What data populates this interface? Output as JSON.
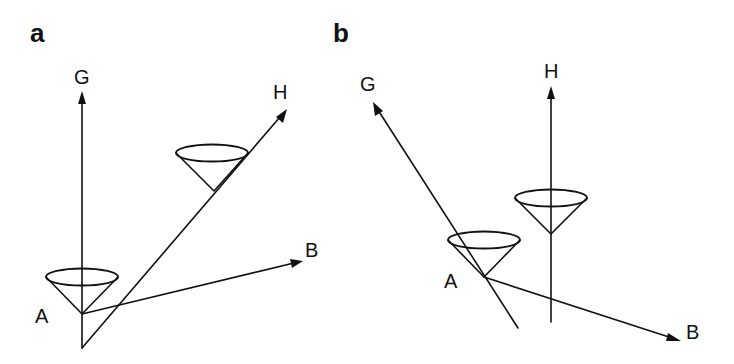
{
  "figure": {
    "panels": [
      {
        "id": "a",
        "label": "a",
        "vectors": {
          "G": {
            "label": "G",
            "direction": "vertical up"
          },
          "H": {
            "label": "H",
            "direction": "diagonal up-right"
          },
          "B": {
            "label": "B",
            "direction": "right, slightly up"
          }
        },
        "point_label": "A",
        "cones": [
          {
            "position": "at A, axis along G"
          },
          {
            "position": "on H line, axis along G"
          }
        ]
      },
      {
        "id": "b",
        "label": "b",
        "vectors": {
          "G": {
            "label": "G",
            "direction": "diagonal up-left"
          },
          "H": {
            "label": "H",
            "direction": "vertical up"
          },
          "B": {
            "label": "B",
            "direction": "right, slightly down"
          }
        },
        "point_label": "A",
        "cones": [
          {
            "position": "at A, axis along H"
          },
          {
            "position": "on H line, axis along H"
          }
        ]
      }
    ],
    "colors": {
      "ink": "#111111",
      "background": "#ffffff"
    }
  }
}
